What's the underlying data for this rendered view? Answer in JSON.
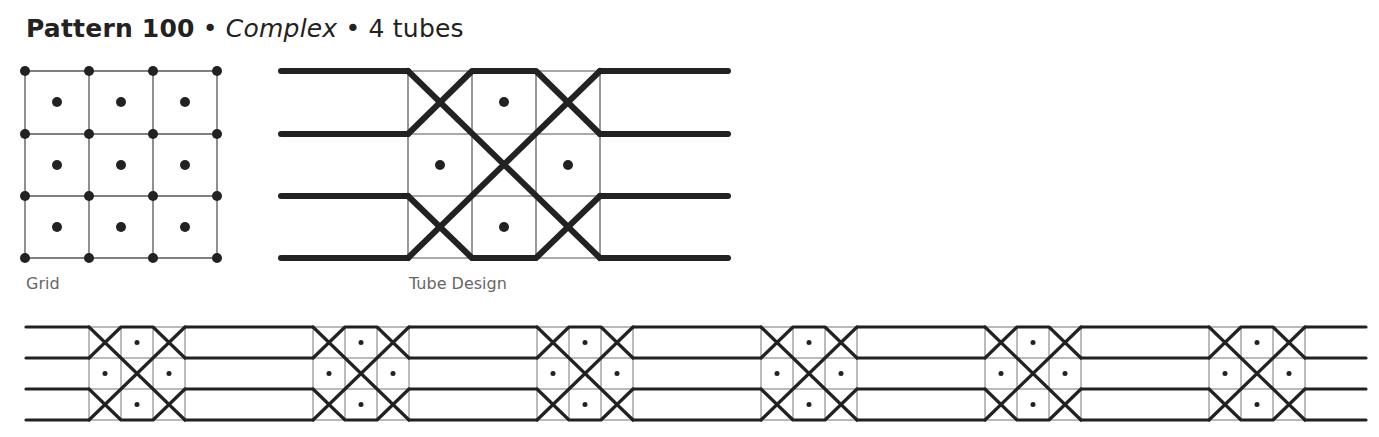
{
  "header": {
    "pattern": "Pattern 100",
    "sep1": " • ",
    "complexity": "Complex",
    "sep2": " • ",
    "tubes": "4 tubes"
  },
  "labels": {
    "grid": "Grid",
    "tube_design": "Tube Design"
  },
  "colors": {
    "ink": "#222222",
    "grid_line": "#555555",
    "label": "#666666"
  },
  "diagram": {
    "grid_size": "3x3",
    "tube_count": 4,
    "repeat_count": 6
  }
}
